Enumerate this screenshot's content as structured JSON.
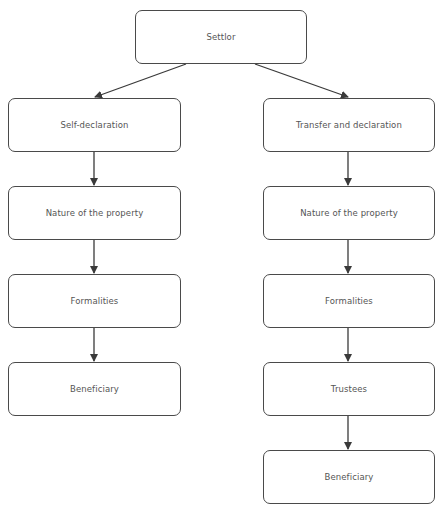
{
  "diagram": {
    "type": "flowchart",
    "root": {
      "id": "settlor",
      "label": "Settlor"
    },
    "left_branch": [
      {
        "id": "self-declaration",
        "label": "Self-declaration"
      },
      {
        "id": "nature-of-property-left",
        "label": "Nature of the property"
      },
      {
        "id": "formalities-left",
        "label": "Formalities"
      },
      {
        "id": "beneficiary-left",
        "label": "Beneficiary"
      }
    ],
    "right_branch": [
      {
        "id": "transfer-and-declaration",
        "label": "Transfer and declaration"
      },
      {
        "id": "nature-of-property-right",
        "label": "Nature of the property"
      },
      {
        "id": "formalities-right",
        "label": "Formalities"
      },
      {
        "id": "trustees",
        "label": "Trustees"
      },
      {
        "id": "beneficiary-right",
        "label": "Beneficiary"
      }
    ],
    "edges": [
      [
        "settlor",
        "self-declaration"
      ],
      [
        "settlor",
        "transfer-and-declaration"
      ],
      [
        "self-declaration",
        "nature-of-property-left"
      ],
      [
        "nature-of-property-left",
        "formalities-left"
      ],
      [
        "formalities-left",
        "beneficiary-left"
      ],
      [
        "transfer-and-declaration",
        "nature-of-property-right"
      ],
      [
        "nature-of-property-right",
        "formalities-right"
      ],
      [
        "formalities-right",
        "trustees"
      ],
      [
        "trustees",
        "beneficiary-right"
      ]
    ],
    "colors": {
      "border": "#4a4a4a",
      "text": "#555555",
      "arrow": "#3a3a3a",
      "background": "#ffffff"
    }
  }
}
